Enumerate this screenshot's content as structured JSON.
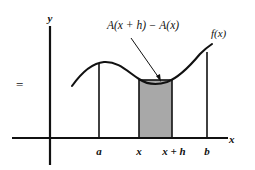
{
  "figure": {
    "kind": "calculus-area-function-diagram",
    "background_color": "#ffffff",
    "ink_color": "#111111",
    "shade_color": "#a8a8a8"
  },
  "axes": {
    "y_axis_label": "y",
    "x_axis_label": "x",
    "origin_x_px": 50,
    "x_axis_y_px": 138,
    "y_axis_top_px": 26,
    "y_axis_bottom_px": 165,
    "x_axis_left_px": 12,
    "x_axis_right_px": 228
  },
  "curve": {
    "label": "f(x)",
    "label_x_px": 213,
    "label_y_px": 34,
    "description": "smooth curve rising to a local maximum between a and x, dipping to a local minimum near x + h, then rising steeply toward b"
  },
  "annotation": {
    "text": "A(x + h) − A(x)",
    "label_x_px": 143,
    "label_y_px": 26,
    "leader_from": [
      131,
      38
    ],
    "leader_to": [
      161,
      81
    ]
  },
  "shaded_region": {
    "name": "area-increment-rectangle",
    "left_px": 139,
    "right_px": 172,
    "top_px": 80,
    "bottom_px": 138,
    "fill": "#a8a8a8",
    "stroke": "#111111"
  },
  "ticks": [
    {
      "id": "a",
      "label": "a",
      "x_px": 99,
      "line_top_px": 63
    },
    {
      "id": "x",
      "label": "x",
      "x_px": 139,
      "line_top_px": 80
    },
    {
      "id": "x_plus_h",
      "label": "x + h",
      "x_px": 172,
      "line_top_px": 80
    },
    {
      "id": "b",
      "label": "b",
      "x_px": 207,
      "line_top_px": 52
    }
  ],
  "stray_marks": {
    "equals_sign": "=",
    "equals_x_px": 16,
    "equals_y_px": 77
  }
}
